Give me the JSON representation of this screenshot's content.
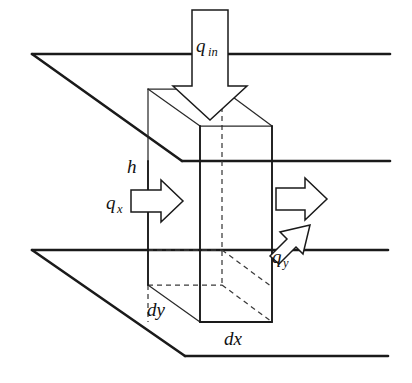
{
  "figure": {
    "type": "technical-diagram",
    "background_color": "#ffffff",
    "line_color": "#1a1a1a",
    "width": 412,
    "height": 383
  },
  "labels": {
    "q_in": {
      "base": "q",
      "sub": "in",
      "x": 196,
      "y": 52,
      "sub_dx": 12,
      "sub_dy": 4
    },
    "q_x": {
      "base": "q",
      "sub": "x",
      "x": 106,
      "y": 209,
      "sub_dx": 11,
      "sub_dy": 4
    },
    "q_y": {
      "base": "q",
      "sub": "y",
      "x": 272,
      "y": 263,
      "sub_dx": 11,
      "sub_dy": 4
    },
    "h": {
      "base": "h",
      "sub": "",
      "x": 127,
      "y": 173,
      "sub_dx": 0,
      "sub_dy": 0
    },
    "dy": {
      "base": "dy",
      "sub": "",
      "x": 147,
      "y": 316,
      "sub_dx": 0,
      "sub_dy": 0
    },
    "dx": {
      "base": "dx",
      "sub": "",
      "x": 224,
      "y": 345,
      "sub_dx": 0,
      "sub_dy": 0
    }
  },
  "geometry": {
    "top_plane": {
      "name": "upper-parallel-plane",
      "points": "32,54 390,54 390,161 182,161"
    },
    "top_plane_edges": [
      {
        "name": "top-plane-back-edge",
        "d": "M 32 54 L 390 54"
      },
      {
        "name": "top-plane-left-edge",
        "d": "M 32 54 L 182 161"
      },
      {
        "name": "top-plane-front-edge",
        "d": "M 182 161 L 390 161"
      },
      {
        "name": "top-plane-right-edge",
        "d": "M 390 54 L 390 161"
      }
    ],
    "bottom_plane_edges": [
      {
        "name": "bottom-plane-back-edge",
        "d": "M 32 250 L 388 250"
      },
      {
        "name": "bottom-plane-left-edge",
        "d": "M 32 250 L 185 356"
      },
      {
        "name": "bottom-plane-front-edge",
        "d": "M 185 356 L 388 356"
      },
      {
        "name": "bottom-plane-right-edge",
        "d": "M 388 250 L 388 356"
      }
    ],
    "box": {
      "top_back_left": [
        148,
        89
      ],
      "top_back_right": [
        222,
        89
      ],
      "top_front_left": [
        200,
        126
      ],
      "top_front_right": [
        272,
        126
      ],
      "bot_back_left": [
        148,
        285
      ],
      "bot_back_right": [
        222,
        285
      ],
      "bot_front_left": [
        200,
        322
      ],
      "bot_front_right": [
        272,
        322
      ]
    },
    "box_edges_solid": [
      {
        "name": "box-edge-front-left-vertical",
        "d": "M 200 126 L 200 322"
      },
      {
        "name": "box-edge-front-right-vertical",
        "d": "M 272 126 L 272 322"
      },
      {
        "name": "box-edge-front-bottom",
        "d": "M 200 322 L 272 322"
      },
      {
        "name": "box-edge-left-back-vertical-upper",
        "d": "M 148 161 L 148 250"
      },
      {
        "name": "box-edge-left-back-vertical-lower",
        "d": "M 148 250 L 148 285"
      }
    ],
    "box_edges_thin": [
      {
        "name": "box-top-face-back-left-to-back-right",
        "d": "M 148 89 L 222 89"
      },
      {
        "name": "box-top-face-back-left-to-front-left",
        "d": "M 148 89 L 200 126"
      },
      {
        "name": "box-top-face-back-right-to-front-right",
        "d": "M 222 89 L 272 126"
      },
      {
        "name": "box-top-face-front-edge",
        "d": "M 200 126 L 272 126"
      },
      {
        "name": "box-edge-left-upper-above-plane",
        "d": "M 148 89 L 148 161"
      },
      {
        "name": "box-bottom-face-left-diagonal",
        "d": "M 148 285 L 200 322"
      }
    ],
    "box_edges_dashed": [
      {
        "name": "box-hidden-back-right-vertical",
        "d": "M 222 89 L 222 285"
      },
      {
        "name": "box-hidden-left-vertical-lower",
        "d": "M 148 285 L 148 322"
      },
      {
        "name": "box-hidden-bottom-back-edge",
        "d": "M 148 285 L 222 285"
      },
      {
        "name": "box-hidden-bottom-right-diagonal",
        "d": "M 222 285 L 272 322"
      },
      {
        "name": "box-hidden-bottom-plane-intersect",
        "d": "M 148 250 L 222 250"
      },
      {
        "name": "box-hidden-bottom-plane-diagonal",
        "d": "M 222 250 L 272 287"
      }
    ]
  },
  "arrows": {
    "q_in": {
      "name": "q-in-arrow",
      "direction": "down",
      "points": "192,10 228,10 228,86 247,86 210,120 173,86 192,86"
    },
    "q_x": {
      "name": "q-x-arrow",
      "direction": "right",
      "points": "131,190 161,190 161,180 183,201 161,222 161,212 131,212"
    },
    "q_out_right": {
      "name": "q-out-arrow",
      "direction": "right",
      "points": "276,188 305,188 305,178 327,199 305,220 305,210 276,210"
    },
    "q_y": {
      "name": "q-y-arrow",
      "direction": "up-left",
      "points": "270,256 287,239 280,232 310,225 303,254 296,247 279,264"
    }
  }
}
